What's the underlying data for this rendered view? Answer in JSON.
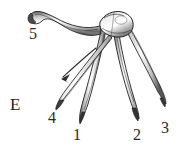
{
  "figure": {
    "panel_letter": "E",
    "medium": "graphite and ink line drawing",
    "background_color": "#ffffff",
    "ink_color": "#2b2b2b",
    "shading_light": "#d8d8d8",
    "shading_mid": "#9a9a9a",
    "shading_dark": "#3a3a3a"
  },
  "labels": [
    {
      "id": "panel",
      "text": "E",
      "x": 10,
      "y": 96,
      "kind": "panel-letter"
    },
    {
      "id": "digit-5",
      "text": "5",
      "x": 29,
      "y": 26,
      "kind": "digit-number"
    },
    {
      "id": "digit-4",
      "text": "4",
      "x": 48,
      "y": 110,
      "kind": "digit-number"
    },
    {
      "id": "digit-1",
      "text": "1",
      "x": 73,
      "y": 127,
      "kind": "digit-number"
    },
    {
      "id": "digit-2",
      "text": "2",
      "x": 133,
      "y": 127,
      "kind": "digit-number"
    },
    {
      "id": "digit-3",
      "text": "3",
      "x": 161,
      "y": 120,
      "kind": "digit-number"
    }
  ],
  "annotations": {
    "leader_arrow": {
      "name": "arrow-pointing-to-digit-4",
      "from_x": 96,
      "from_y": 48,
      "to_x": 61,
      "to_y": 79
    }
  },
  "structures": [
    {
      "name": "hallux-digit-5",
      "description": "recurved hooked digit sweeping up and to the left"
    },
    {
      "name": "tarsal-junction",
      "description": "knotted cluster where all digits converge at top center"
    },
    {
      "name": "digit-4-shaft",
      "description": "slender tapering digit angled to lower left"
    },
    {
      "name": "digit-1-shaft",
      "description": "digit descending to lower left of center"
    },
    {
      "name": "digit-2-shaft",
      "description": "digit descending to lower right of center"
    },
    {
      "name": "digit-3-shaft",
      "description": "outermost digit descending to far right"
    }
  ]
}
